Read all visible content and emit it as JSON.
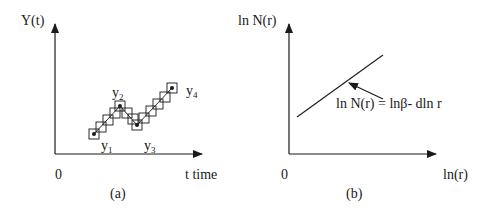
{
  "panel_a": {
    "y_axis_label": "Y(t)",
    "x_axis_label": "t time",
    "origin_label": "0",
    "caption": "(a)",
    "points": [
      {
        "name": "y",
        "sub": "1"
      },
      {
        "name": "y",
        "sub": "2"
      },
      {
        "name": "y",
        "sub": "3"
      },
      {
        "name": "y",
        "sub": "4"
      }
    ]
  },
  "panel_b": {
    "y_axis_label": "ln N(r)",
    "x_axis_label": "ln(r)",
    "origin_label": "0",
    "caption": "(b)",
    "equation": "ln N(r) = lnβ- dln r"
  },
  "colors": {
    "ink": "#1a1a1a",
    "background": "#ffffff"
  }
}
